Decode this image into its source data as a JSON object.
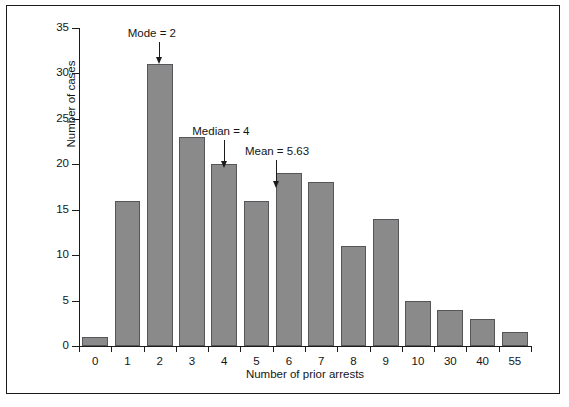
{
  "chart_data": {
    "type": "bar",
    "title": "",
    "xlabel": "Number of prior arrests",
    "ylabel": "Number of cases",
    "categories": [
      "0",
      "1",
      "2",
      "3",
      "4",
      "5",
      "6",
      "7",
      "8",
      "9",
      "10",
      "30",
      "40",
      "55"
    ],
    "values": [
      1,
      16,
      31,
      23,
      20,
      16,
      19,
      18,
      11,
      14,
      5,
      4,
      3,
      1.5
    ],
    "ylim": [
      0,
      35
    ],
    "yticks": [
      0,
      5,
      10,
      15,
      20,
      25,
      30,
      35
    ],
    "grid": false,
    "legend": null,
    "bar_color": "#8a8a8a",
    "bar_edge_color": "#55555a",
    "annotations": [
      {
        "label": "Mode = 2",
        "category": "2",
        "value": 2
      },
      {
        "label": "Median = 4",
        "category": "4",
        "value": 4
      },
      {
        "label": "Mean = 5.63",
        "category": "5.63",
        "value": 5.63
      }
    ]
  },
  "figure": {
    "frame_color": "#1b1b1b",
    "background": "#ffffff"
  }
}
